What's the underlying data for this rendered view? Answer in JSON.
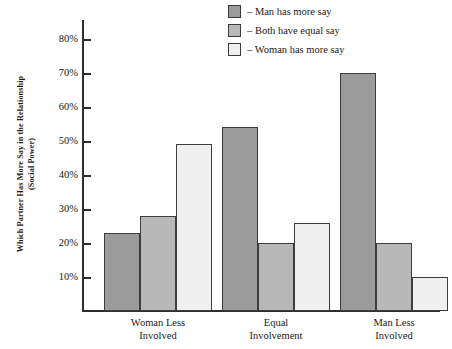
{
  "chart_data": {
    "type": "bar",
    "title": "",
    "xlabel": "",
    "ylabel": "Which Partner Has More Say in the Relationship (Social Power)",
    "ylabel_line1": "Which Partner Has More Say in the Relationship",
    "ylabel_line2": "(Social Power)",
    "categories": [
      "Woman Less Involved",
      "Equal Involvement",
      "Man Less Involved"
    ],
    "category_lines": [
      [
        "Woman Less",
        "Involved"
      ],
      [
        "Equal",
        "Involvement"
      ],
      [
        "Man Less",
        "Involved"
      ]
    ],
    "series": [
      {
        "name": "Man has more say",
        "legend_label": "– Man has more say",
        "color": "#9b9b9b",
        "values": [
          23,
          54,
          70
        ]
      },
      {
        "name": "Both have equal say",
        "legend_label": "– Both have equal say",
        "color": "#b8b8b8",
        "values": [
          28,
          20,
          20
        ]
      },
      {
        "name": "Woman has more say",
        "legend_label": "– Woman has more say",
        "color": "#f0f0f0",
        "values": [
          49,
          26,
          10
        ]
      }
    ],
    "ytick_labels": [
      "80%",
      "70%",
      "60%",
      "50%",
      "40%",
      "30%",
      "20%",
      "10%"
    ],
    "ytick_values": [
      80,
      70,
      60,
      50,
      40,
      30,
      20,
      10
    ],
    "ylim": [
      0,
      85
    ],
    "yunit": "%",
    "grid": false,
    "legend_position": "top-center-right",
    "bar_outline_color": "#3d3d3d",
    "axis_color": "#2e2e2e"
  }
}
